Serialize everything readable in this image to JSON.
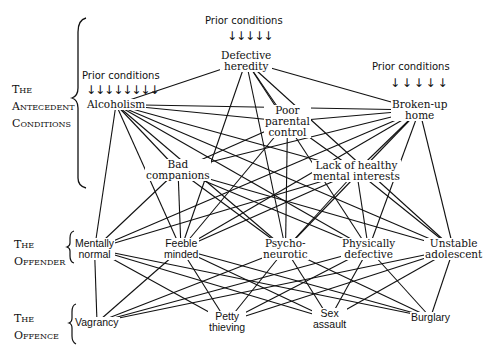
{
  "sections": {
    "antecedent": [
      "The",
      "Antecedent",
      "Conditions"
    ],
    "offender": [
      "The",
      "Offender"
    ],
    "offence": [
      "The",
      "Offence"
    ]
  },
  "prior_label": "Prior conditions",
  "arrows": {
    "alcoholism": "↓↓↓↓↓↓↓↓",
    "heredity": "↓↓↓↓↓",
    "broken_home": "↓ ↓ ↓ ↓ ↓"
  },
  "nodes": {
    "alcoholism": "Alcoholism",
    "heredity": [
      "Defective",
      "heredity"
    ],
    "poor_control": [
      "Poor",
      "parental",
      "control"
    ],
    "broken_home": [
      "Broken-up",
      "home"
    ],
    "bad_companions": [
      "Bad",
      "companions"
    ],
    "lack_interests": [
      "Lack of healthy",
      "mental interests"
    ],
    "mentally_normal": [
      "Mentally",
      "normal"
    ],
    "feeble_minded": [
      "Feeble",
      "minded"
    ],
    "psychoneurotic": [
      "Psycho-",
      "neurotic"
    ],
    "physically_defective": [
      "Physically",
      "defective"
    ],
    "unstable_adolescent": [
      "Unstable",
      "adolescent"
    ],
    "vagrancy": "Vagrancy",
    "petty_thieving": [
      "Petty",
      "thieving"
    ],
    "sex_assault": [
      "Sex",
      "assault"
    ],
    "burglary": "Burglary"
  },
  "edges": [
    [
      "alcoholism",
      "heredity"
    ],
    [
      "alcoholism",
      "broken_home"
    ],
    [
      "alcoholism",
      "poor_control"
    ],
    [
      "alcoholism",
      "bad_companions"
    ],
    [
      "alcoholism",
      "lack_interests"
    ],
    [
      "alcoholism",
      "mentally_normal"
    ],
    [
      "alcoholism",
      "feeble_minded"
    ],
    [
      "alcoholism",
      "psychoneurotic"
    ],
    [
      "alcoholism",
      "physically_defective"
    ],
    [
      "alcoholism",
      "unstable_adolescent"
    ],
    [
      "heredity",
      "broken_home"
    ],
    [
      "heredity",
      "poor_control"
    ],
    [
      "heredity",
      "feeble_minded"
    ],
    [
      "heredity",
      "psychoneurotic"
    ],
    [
      "heredity",
      "physically_defective"
    ],
    [
      "heredity",
      "unstable_adolescent"
    ],
    [
      "broken_home",
      "poor_control"
    ],
    [
      "broken_home",
      "bad_companions"
    ],
    [
      "broken_home",
      "lack_interests"
    ],
    [
      "broken_home",
      "mentally_normal"
    ],
    [
      "broken_home",
      "feeble_minded"
    ],
    [
      "broken_home",
      "psychoneurotic"
    ],
    [
      "broken_home",
      "physically_defective"
    ],
    [
      "broken_home",
      "unstable_adolescent"
    ],
    [
      "poor_control",
      "bad_companions"
    ],
    [
      "poor_control",
      "lack_interests"
    ],
    [
      "poor_control",
      "feeble_minded"
    ],
    [
      "poor_control",
      "psychoneurotic"
    ],
    [
      "bad_companions",
      "mentally_normal"
    ],
    [
      "bad_companions",
      "feeble_minded"
    ],
    [
      "bad_companions",
      "psychoneurotic"
    ],
    [
      "bad_companions",
      "physically_defective"
    ],
    [
      "bad_companions",
      "unstable_adolescent"
    ],
    [
      "lack_interests",
      "mentally_normal"
    ],
    [
      "lack_interests",
      "feeble_minded"
    ],
    [
      "lack_interests",
      "psychoneurotic"
    ],
    [
      "lack_interests",
      "physically_defective"
    ],
    [
      "lack_interests",
      "unstable_adolescent"
    ],
    [
      "mentally_normal",
      "vagrancy"
    ],
    [
      "mentally_normal",
      "petty_thieving"
    ],
    [
      "mentally_normal",
      "sex_assault"
    ],
    [
      "mentally_normal",
      "burglary"
    ],
    [
      "feeble_minded",
      "vagrancy"
    ],
    [
      "feeble_minded",
      "petty_thieving"
    ],
    [
      "feeble_minded",
      "sex_assault"
    ],
    [
      "feeble_minded",
      "burglary"
    ],
    [
      "psychoneurotic",
      "vagrancy"
    ],
    [
      "psychoneurotic",
      "petty_thieving"
    ],
    [
      "psychoneurotic",
      "sex_assault"
    ],
    [
      "psychoneurotic",
      "burglary"
    ],
    [
      "physically_defective",
      "vagrancy"
    ],
    [
      "physically_defective",
      "petty_thieving"
    ],
    [
      "physically_defective",
      "sex_assault"
    ],
    [
      "physically_defective",
      "burglary"
    ],
    [
      "unstable_adolescent",
      "vagrancy"
    ],
    [
      "unstable_adolescent",
      "petty_thieving"
    ],
    [
      "unstable_adolescent",
      "sex_assault"
    ],
    [
      "unstable_adolescent",
      "burglary"
    ]
  ]
}
